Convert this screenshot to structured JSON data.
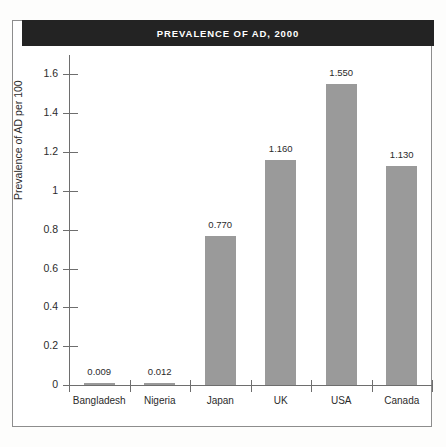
{
  "figure": {
    "title": "PREVALENCE OF AD, 2000",
    "banner_color": "#232323",
    "bar_color": "#9a9a9a",
    "axis_color": "#6e6e6e",
    "frame_color": "#8d8d8d",
    "background": "#ffffff"
  },
  "chart_data": {
    "type": "bar",
    "title": "PREVALENCE OF AD, 2000",
    "xlabel": "",
    "ylabel": "Prevalence of AD per 100",
    "categories": [
      "Bangladesh",
      "Nigeria",
      "Japan",
      "UK",
      "USA",
      "Canada"
    ],
    "values": [
      0.009,
      0.012,
      0.77,
      1.16,
      1.55,
      1.13
    ],
    "data_labels": [
      "0.009",
      "0.012",
      "0.770",
      "1.160",
      "1.550",
      "1.130"
    ],
    "ylim": [
      0,
      1.7
    ],
    "yticks": [
      0,
      0.2,
      0.4,
      0.6,
      0.8,
      1,
      1.2,
      1.4,
      1.6
    ],
    "ytick_labels": [
      "0",
      "0.2",
      "0.4",
      "0.6",
      "0.8",
      "1",
      "1.2",
      "1.4",
      "1.6"
    ],
    "grid": false,
    "legend": null,
    "series": [
      {
        "name": "Prevalence of AD per 100",
        "values": [
          0.009,
          0.012,
          0.77,
          1.16,
          1.55,
          1.13
        ]
      }
    ]
  }
}
